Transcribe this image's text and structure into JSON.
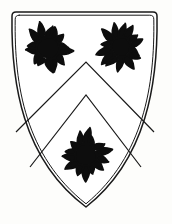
{
  "image": {
    "kind": "heraldic-achievement",
    "title": "Coat of Arms",
    "blazon": "Argent, a chevron between three estoiles sable",
    "background_color": "#fdfdfb",
    "ink_color": "#1a1a1a",
    "width": 172,
    "height": 224
  },
  "shield": {
    "name": "escutcheon",
    "field_tincture_label": "Argent",
    "field_color": "#ffffff",
    "outline_color": "#1a1a1a",
    "outline_style": "double-line",
    "outer_stroke_width": 1.5,
    "inner_stroke_width": 1.0,
    "top_left": [
      12,
      12
    ],
    "top_right": [
      157,
      12
    ],
    "base_point": [
      86,
      207
    ],
    "corner_radius": 4
  },
  "ordinary": {
    "name": "chevron",
    "tincture_label": "Sable",
    "style": "voided-outline",
    "stroke_color": "#1a1a1a",
    "stroke_width": 1.2,
    "outer_apex": [
      86,
      62
    ],
    "inner_apex": [
      86,
      95
    ],
    "outer_left_end": [
      16,
      132
    ],
    "outer_right_end": [
      154,
      132
    ],
    "inner_left_end": [
      30,
      167
    ],
    "inner_right_end": [
      141,
      167
    ]
  },
  "charges": [
    {
      "name": "estoile-dexter-chief",
      "label": "Estoile in dexter chief",
      "tincture_label": "Sable",
      "color": "#0d0d0d",
      "center": [
        48,
        48
      ],
      "outer_radius": 27,
      "inner_radius": 11,
      "ray_count": 14,
      "ray_style": "wavy"
    },
    {
      "name": "estoile-sinister-chief",
      "label": "Estoile in sinister chief",
      "tincture_label": "Sable",
      "color": "#0d0d0d",
      "center": [
        121,
        47
      ],
      "outer_radius": 26,
      "inner_radius": 10,
      "ray_count": 14,
      "ray_style": "wavy"
    },
    {
      "name": "estoile-base",
      "label": "Estoile in base",
      "tincture_label": "Sable",
      "color": "#0d0d0d",
      "center": [
        86,
        155
      ],
      "outer_radius": 27,
      "inner_radius": 11,
      "ray_count": 14,
      "ray_style": "wavy"
    }
  ]
}
